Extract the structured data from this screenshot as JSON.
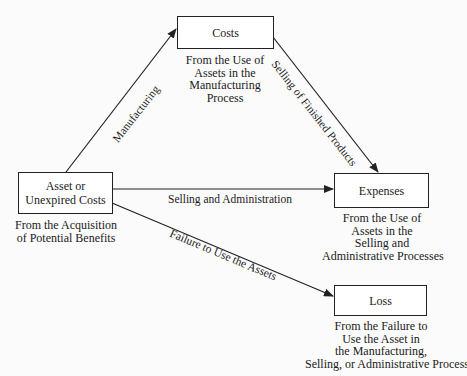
{
  "diagram": {
    "nodes": {
      "asset": {
        "title_line1": "Asset or",
        "title_line2": "Unexpired Costs",
        "caption_line1": "From the Acquisition",
        "caption_line2": "of Potential Benefits"
      },
      "costs": {
        "title": "Costs",
        "caption_line1": "From the Use of",
        "caption_line2": "Assets in the",
        "caption_line3": "Manufacturing",
        "caption_line4": "Process"
      },
      "expenses": {
        "title": "Expenses",
        "caption_line1": "From the Use of",
        "caption_line2": "Assets in the",
        "caption_line3": "Selling and",
        "caption_line4": "Administrative Processes"
      },
      "loss": {
        "title": "Loss",
        "caption_line1": "From the Failure to",
        "caption_line2": "Use the Asset in",
        "caption_line3": "the Manufacturing,",
        "caption_line4": "Selling, or Administrative Process"
      }
    },
    "edges": {
      "asset_to_costs": "Manufacturing",
      "costs_to_expenses": "Selling of Finished Products",
      "asset_to_expenses": "Selling and Administration",
      "asset_to_loss": "Failure to Use the Assets"
    },
    "colors": {
      "line": "#222222",
      "background": "#fbfbfb"
    }
  }
}
